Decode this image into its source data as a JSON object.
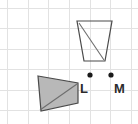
{
  "canvas": {
    "width": 138,
    "height": 124,
    "background_color": "#ffffff"
  },
  "grid": {
    "line_color": "#e2e2e2",
    "spacing_px": 20.6,
    "vertical_x": [
      7,
      28,
      48,
      69,
      90,
      110,
      131
    ],
    "horizontal_y": [
      8,
      28,
      49,
      69,
      90,
      110
    ]
  },
  "shapes": [
    {
      "id": "top-trapezoid",
      "name": "unfilled-trapezoid",
      "fill": "none",
      "stroke": "#4a4a4a",
      "points": "77,21 112,21 105,61 84,61",
      "diagonal": {
        "x1": 79,
        "y1": 23,
        "x2": 104,
        "y2": 60
      }
    },
    {
      "id": "bottom-quadrilateral",
      "name": "shaded-quadrilateral",
      "fill": "#b8b8b8",
      "stroke": "#4a4a4a",
      "points": "38,76 78,83 78,103 41,111",
      "diagonal": {
        "x1": 40,
        "y1": 110,
        "x2": 77,
        "y2": 84
      }
    }
  ],
  "points": [
    {
      "id": "point-l",
      "label": "L",
      "dot_x": 90,
      "dot_y": 75,
      "label_x": 80,
      "label_y": 93,
      "color": "#1a1a1a"
    },
    {
      "id": "point-m",
      "label": "M",
      "dot_x": 111,
      "dot_y": 75,
      "label_x": 114,
      "label_y": 93,
      "color": "#1a1a1a"
    }
  ]
}
